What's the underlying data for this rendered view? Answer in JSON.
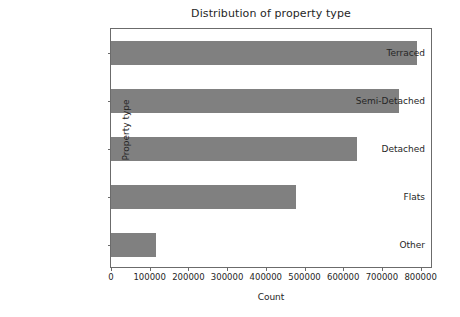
{
  "chart_data": {
    "type": "bar",
    "orientation": "horizontal",
    "title": "Distribution of property type",
    "xlabel": "Count",
    "ylabel": "Property type",
    "categories": [
      "Terraced",
      "Semi-Detached",
      "Detached",
      "Flats",
      "Other"
    ],
    "values": [
      790000,
      745000,
      635000,
      477000,
      117000
    ],
    "xlim": [
      0,
      832000
    ],
    "xticks": [
      0,
      100000,
      200000,
      300000,
      400000,
      500000,
      600000,
      700000,
      800000
    ],
    "xtick_labels": [
      "0",
      "100000",
      "200000",
      "300000",
      "400000",
      "500000",
      "600000",
      "700000",
      "800000"
    ],
    "grid": false,
    "legend": null,
    "bar_color": "#808080",
    "axes_color": "#6b6b6b",
    "background_color": "#ffffff"
  }
}
